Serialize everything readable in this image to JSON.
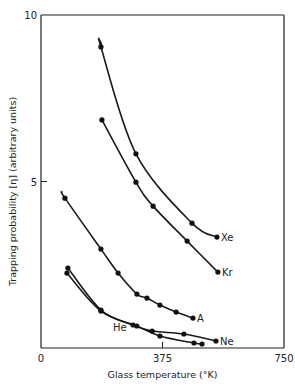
{
  "chart_data": {
    "type": "line",
    "title": "",
    "xlabel": "Glass temperature (°K)",
    "ylabel": "Trapping probability [η] (arbitrary units)",
    "xlim": [
      0,
      750
    ],
    "ylim": [
      0,
      10
    ],
    "xticks": [
      {
        "value": 0,
        "label": "0"
      },
      {
        "value": 375,
        "label": "375"
      },
      {
        "value": 750,
        "label": "750"
      }
    ],
    "yticks": [
      {
        "value": 5,
        "label": "5"
      },
      {
        "value": 10,
        "label": "10"
      }
    ],
    "grid": false,
    "legend": "inline labels at curve ends",
    "series": [
      {
        "name": "Xe",
        "points": [
          [
            185,
            9.04
          ],
          [
            293,
            5.83
          ],
          [
            466,
            3.75
          ],
          [
            543,
            3.33
          ]
        ],
        "curve_start": [
          188,
          9.1
        ]
      },
      {
        "name": "Kr",
        "points": [
          [
            188,
            6.85
          ],
          [
            293,
            4.98
          ],
          [
            346,
            4.26
          ],
          [
            451,
            3.21
          ],
          [
            546,
            2.28
          ]
        ]
      },
      {
        "name": "A",
        "points": [
          [
            74,
            4.5
          ],
          [
            185,
            2.97
          ],
          [
            238,
            2.25
          ],
          [
            296,
            1.62
          ],
          [
            327,
            1.5
          ],
          [
            367,
            1.29
          ],
          [
            417,
            1.08
          ],
          [
            469,
            0.9
          ]
        ],
        "curve_start": [
          65,
          4.7
        ]
      },
      {
        "name": "Ne",
        "points": [
          [
            83,
            2.4
          ],
          [
            185,
            1.14
          ],
          [
            284,
            0.69
          ],
          [
            343,
            0.51
          ],
          [
            441,
            0.42
          ],
          [
            540,
            0.21
          ]
        ]
      },
      {
        "name": "He",
        "points": [
          [
            80,
            2.25
          ],
          [
            185,
            1.11
          ],
          [
            296,
            0.66
          ],
          [
            367,
            0.36
          ],
          [
            472,
            0.15
          ],
          [
            497,
            0.12
          ]
        ]
      }
    ],
    "annotations": [
      {
        "series": "Xe",
        "text": "Xe",
        "position": "right of last point"
      },
      {
        "series": "Kr",
        "text": "Kr",
        "position": "right of last point"
      },
      {
        "series": "A",
        "text": "A",
        "position": "right of last point"
      },
      {
        "series": "Ne",
        "text": "Ne",
        "position": "right of last point"
      },
      {
        "series": "He",
        "text": "He",
        "position": "left, above curve near 300°K"
      }
    ]
  }
}
